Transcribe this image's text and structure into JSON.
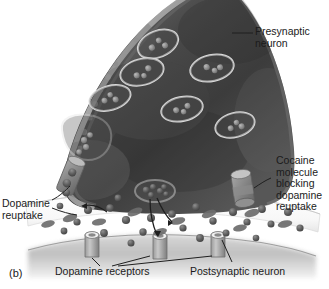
{
  "figure": {
    "panel_label": "(b)",
    "kind": "biology-illustration",
    "style": "grayscale halftone textbook drawing"
  },
  "labels": {
    "presynaptic": "Presynaptic\nneuron",
    "cocaine": "Cocaine\nmolecule\nblocking\ndopamine\nreuptake",
    "reuptake": "Dopamine\nreuptake",
    "receptors": "Dopamine receptors",
    "postsynaptic": "Postsynaptic neuron"
  },
  "colors": {
    "background": "#ffffff",
    "terminal_dark": "#3a3a3a",
    "terminal_mid": "#5c5c5c",
    "terminal_rim": "#b9b9b9",
    "cleft_white": "#fbfbfb",
    "postsynaptic_gray": "#c9c9c9",
    "molecule_dark": "#555555",
    "vesicle_outline": "#d8d8d8",
    "leader_line": "#2a2a2a",
    "text": "#1b1b1b"
  },
  "structures": {
    "vesicles": [
      {
        "cx": 158,
        "cy": 44,
        "rx": 21,
        "ry": 13,
        "rot": -22,
        "dots": [
          [
            -7,
            1
          ],
          [
            2,
            -3
          ],
          [
            6,
            4
          ]
        ]
      },
      {
        "cx": 142,
        "cy": 72,
        "rx": 22,
        "ry": 13,
        "rot": -14,
        "dots": [
          [
            -6,
            2
          ],
          [
            1,
            4
          ],
          [
            7,
            -2
          ]
        ]
      },
      {
        "cx": 212,
        "cy": 68,
        "rx": 22,
        "ry": 13,
        "rot": -12,
        "dots": [
          [
            -5,
            -2
          ],
          [
            2,
            3
          ],
          [
            8,
            1
          ]
        ]
      },
      {
        "cx": 110,
        "cy": 98,
        "rx": 21,
        "ry": 12,
        "rot": -16,
        "dots": [
          [
            -6,
            1
          ],
          [
            1,
            -3
          ],
          [
            5,
            3
          ]
        ]
      },
      {
        "cx": 182,
        "cy": 109,
        "rx": 21,
        "ry": 12,
        "rot": -12,
        "dots": [
          [
            -6,
            0
          ],
          [
            1,
            3
          ],
          [
            6,
            -2
          ]
        ]
      },
      {
        "cx": 235,
        "cy": 125,
        "rx": 20,
        "ry": 12,
        "rot": -15,
        "dots": [
          [
            -5,
            2
          ],
          [
            2,
            -2
          ],
          [
            6,
            3
          ]
        ]
      },
      {
        "cx": 86,
        "cy": 138,
        "rx": 26,
        "ry": 22,
        "rot": -8,
        "dots": [
          [
            -2,
            2
          ],
          [
            4,
            -3
          ],
          [
            0,
            9
          ],
          [
            -7,
            12
          ]
        ],
        "shape": "irregular"
      }
    ],
    "fusing_vesicle": {
      "cx": 155,
      "cy": 191,
      "rx": 19,
      "ry": 11,
      "dots": [
        [
          -8,
          -1
        ],
        [
          -1,
          -4
        ],
        [
          5,
          1
        ],
        [
          -3,
          4
        ],
        [
          7,
          -4
        ]
      ]
    },
    "transporters": [
      {
        "name": "dopamine-reuptake-transporter",
        "x": 68,
        "y": 172,
        "rot": 20,
        "blocked": false
      },
      {
        "name": "cocaine-blocked-transporter",
        "x": 242,
        "y": 186,
        "rot": -8,
        "blocked": true
      }
    ],
    "receptors": [
      {
        "cx": 92,
        "cy": 243
      },
      {
        "cx": 160,
        "cy": 245
      },
      {
        "cx": 218,
        "cy": 243
      }
    ],
    "dopamine_molecules": [
      [
        88,
        210
      ],
      [
        110,
        208
      ],
      [
        126,
        220
      ],
      [
        143,
        232
      ],
      [
        77,
        222
      ],
      [
        64,
        231
      ],
      [
        104,
        233
      ],
      [
        131,
        243
      ],
      [
        151,
        218
      ],
      [
        172,
        214
      ],
      [
        183,
        228
      ],
      [
        200,
        238
      ],
      [
        213,
        221
      ],
      [
        233,
        212
      ],
      [
        247,
        222
      ],
      [
        262,
        209
      ],
      [
        271,
        224
      ],
      [
        288,
        212
      ],
      [
        300,
        228
      ],
      [
        196,
        207
      ],
      [
        160,
        205
      ],
      [
        118,
        198
      ],
      [
        60,
        206
      ],
      [
        226,
        233
      ],
      [
        256,
        238
      ]
    ],
    "oval_molecules": [
      [
        70,
        218,
        -18
      ],
      [
        99,
        222,
        -10
      ],
      [
        135,
        212,
        -22
      ],
      [
        178,
        221,
        -14
      ],
      [
        209,
        214,
        -20
      ],
      [
        252,
        213,
        -16
      ],
      [
        285,
        224,
        -12
      ],
      [
        48,
        224,
        -14
      ],
      [
        160,
        232,
        -18
      ],
      [
        240,
        228,
        -12
      ]
    ]
  }
}
